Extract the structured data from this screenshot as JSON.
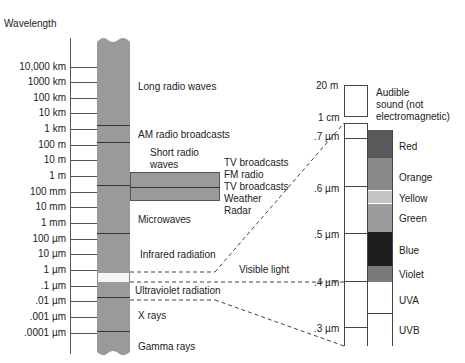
{
  "title": "Wavelength",
  "scale": {
    "ticks": [
      {
        "label": "10,000 km",
        "y": 67
      },
      {
        "label": "1000 km",
        "y": 82
      },
      {
        "label": "100 km",
        "y": 98
      },
      {
        "label": "10 km",
        "y": 113
      },
      {
        "label": "1 km",
        "y": 129
      },
      {
        "label": "100 m",
        "y": 145
      },
      {
        "label": "10 m",
        "y": 160
      },
      {
        "label": "1 m",
        "y": 176
      },
      {
        "label": "100 mm",
        "y": 192
      },
      {
        "label": "10 mm",
        "y": 207
      },
      {
        "label": "1 mm",
        "y": 223
      },
      {
        "label": "100  µm",
        "y": 239
      },
      {
        "label": "10 µm",
        "y": 254
      },
      {
        "label": "1 µm",
        "y": 270
      },
      {
        "label": ".1 µm",
        "y": 286
      },
      {
        "label": ".01 µm",
        "y": 301
      },
      {
        "label": ".001 µm",
        "y": 317
      },
      {
        "label": ".0001 µm",
        "y": 333
      }
    ]
  },
  "bands": {
    "long_radio": "Long radio waves",
    "am_radio": "AM radio broadcasts",
    "short_radio_1": "Short radio",
    "short_radio_2": "waves",
    "tv1": "TV broadcasts",
    "fm": "FM radio",
    "tv2": "TV broadcasts",
    "weather": "Weather",
    "radar": "Radar",
    "microwaves": "Microwaves",
    "infrared": "Infrared radiation",
    "visible": "Visible light",
    "ultraviolet": "Ultraviolet radiation",
    "xrays": "X rays",
    "gamma": "Gamma rays"
  },
  "detail_scale": {
    "audible": {
      "top_label": "20 m",
      "bottom_label": "1 cm",
      "text_1": "Audible",
      "text_2": "sound (not",
      "text_3": "electromagnetic)"
    },
    "ticks": [
      ".7 µm",
      ".6 µm",
      ".5 µm",
      ".4 µm",
      ".3 µm"
    ],
    "colors": [
      {
        "label": "Red",
        "color": "#5a5a5a"
      },
      {
        "label": "Orange",
        "color": "#8a8a8a"
      },
      {
        "label": "Yellow",
        "color": "#c4c4c4"
      },
      {
        "label": "Green",
        "color": "#9c9c9c"
      },
      {
        "label": "Blue",
        "color": "#1e1e1e"
      },
      {
        "label": "Violet",
        "color": "#7a7a7a"
      }
    ],
    "uv": [
      "UVA",
      "UVB"
    ]
  }
}
